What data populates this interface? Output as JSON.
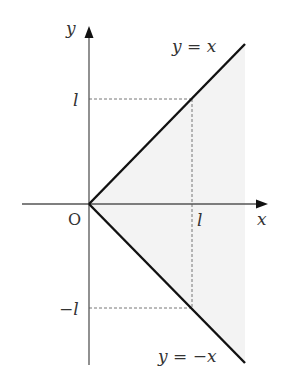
{
  "diagram": {
    "type": "coordinate-region",
    "axes": {
      "x_label": "x",
      "y_label": "y",
      "origin_label": "O"
    },
    "ticks": {
      "x_tick_label": "l",
      "y_tick_pos_label": "l",
      "y_tick_neg_label": "−l"
    },
    "lines": [
      {
        "name": "upper-line",
        "label": "y = x"
      },
      {
        "name": "lower-line",
        "label": "y = −x"
      }
    ],
    "colors": {
      "axis": "#555555",
      "line": "#111111",
      "dashed": "#777777",
      "shade": "#f3f3f3",
      "text": "#333333"
    }
  }
}
